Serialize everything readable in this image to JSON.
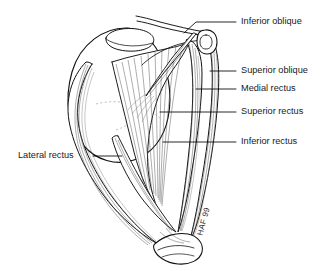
{
  "figure": {
    "background_color": "#ffffff",
    "ink_color": "#111111",
    "width": 329,
    "height": 271
  },
  "labels": [
    {
      "id": "inferior-oblique",
      "text": "Inferior oblique",
      "side": "right",
      "text_x": 241,
      "text_y": 22,
      "leader": "M 236 22 L 196 22 L 184 33"
    },
    {
      "id": "superior-oblique",
      "text": "Superior oblique",
      "side": "right",
      "text_x": 241,
      "text_y": 71,
      "leader": "M 236 71 L 210 71"
    },
    {
      "id": "medial-rectus",
      "text": "Medial rectus",
      "side": "right",
      "text_x": 241,
      "text_y": 89,
      "leader": "M 236 89 L 196 89"
    },
    {
      "id": "superior-rectus",
      "text": "Superior rectus",
      "side": "right",
      "text_x": 241,
      "text_y": 112,
      "leader": "M 236 112 L 160 112"
    },
    {
      "id": "inferior-rectus",
      "text": "Inferior rectus",
      "side": "right",
      "text_x": 241,
      "text_y": 142,
      "leader": "M 236 142 L 163 142"
    },
    {
      "id": "lateral-rectus",
      "text": "Lateral rectus",
      "side": "left",
      "text_x": 18,
      "text_y": 156,
      "leader": "M 93 156 L 122 156"
    }
  ],
  "signature": {
    "text": "HAF 99",
    "x": 206,
    "y": 222,
    "rotation": -75
  },
  "structures": [
    {
      "id": "globe",
      "name": "eyeball-globe"
    },
    {
      "id": "cornea",
      "name": "cornea-ellipse"
    },
    {
      "id": "trochlea",
      "name": "trochlea-pulley"
    },
    {
      "id": "orbital-apex",
      "name": "annulus-of-zinn"
    },
    {
      "id": "superior-oblique-tendon",
      "name": "superior-oblique-tendon"
    },
    {
      "id": "inferior-oblique-muscle",
      "name": "inferior-oblique-muscle"
    },
    {
      "id": "superior-rectus-muscle",
      "name": "superior-rectus-muscle"
    },
    {
      "id": "medial-rectus-muscle",
      "name": "medial-rectus-muscle"
    },
    {
      "id": "inferior-rectus-muscle",
      "name": "inferior-rectus-muscle"
    },
    {
      "id": "lateral-rectus-muscle",
      "name": "lateral-rectus-muscle"
    }
  ]
}
